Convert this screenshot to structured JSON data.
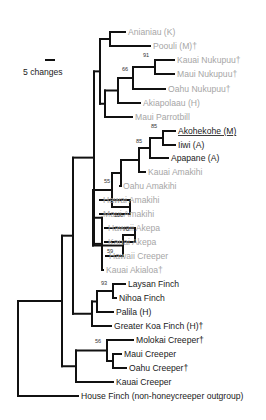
{
  "figure": {
    "scale_bar": {
      "label": "5 changes"
    },
    "leaves": [
      {
        "id": "anianiau",
        "label": "Anianiau (K)",
        "status": "gray"
      },
      {
        "id": "poouli",
        "label": "Poouli (M)†",
        "status": "gray"
      },
      {
        "id": "kauai-nukupuu",
        "label": "Kauai Nukupuu†",
        "status": "gray"
      },
      {
        "id": "maui-nukupuu",
        "label": "Maui Nukupuu†",
        "status": "gray"
      },
      {
        "id": "oahu-nukupuu",
        "label": "Oahu Nukupuu†",
        "status": "gray"
      },
      {
        "id": "akiapolaau",
        "label": "Akiapolaau (H)",
        "status": "gray"
      },
      {
        "id": "maui-parrotbill",
        "label": "Maui Parrotbill",
        "status": "gray"
      },
      {
        "id": "akohekohe",
        "label": "Akohekohe (M)",
        "status": "dark",
        "underline": true
      },
      {
        "id": "iiwi",
        "label": "Iiwi (A)",
        "status": "dark"
      },
      {
        "id": "apapane",
        "label": "Apapane (A)",
        "status": "dark"
      },
      {
        "id": "kauai-amakihi",
        "label": "Kauai Amakihi",
        "status": "gray"
      },
      {
        "id": "oahu-amakihi",
        "label": "Oahu Amakihi",
        "status": "gray"
      },
      {
        "id": "hawai-amakihi",
        "label": "Hawai Amakihi",
        "status": "gray"
      },
      {
        "id": "maui-amakihi",
        "label": "Maui Amakihi",
        "status": "gray"
      },
      {
        "id": "hawaii-akepa",
        "label": "Hawaii Akepa",
        "status": "gray"
      },
      {
        "id": "kauai-akepa",
        "label": "Kauai Akepa",
        "status": "gray"
      },
      {
        "id": "hawaii-creeper",
        "label": "Hawaii Creeper",
        "status": "gray"
      },
      {
        "id": "kauai-akialoa",
        "label": "Kauai Akialoa†",
        "status": "gray"
      },
      {
        "id": "laysan-finch",
        "label": "Laysan Finch",
        "status": "dark"
      },
      {
        "id": "nihoa-finch",
        "label": "Nihoa Finch",
        "status": "dark"
      },
      {
        "id": "palila",
        "label": "Palila (H)",
        "status": "dark"
      },
      {
        "id": "greater-koa-finch",
        "label": "Greater Koa Finch (H)†",
        "status": "dark"
      },
      {
        "id": "molokai-creeper",
        "label": "Molokai Creeper†",
        "status": "dark"
      },
      {
        "id": "maui-creeper",
        "label": "Maui Creeper",
        "status": "dark"
      },
      {
        "id": "oahu-creeper",
        "label": "Oahu Creeper†",
        "status": "dark"
      },
      {
        "id": "kauai-creeper",
        "label": "Kauai Creeper",
        "status": "dark"
      },
      {
        "id": "house-finch",
        "label": "House Finch (non-honeycreeper outgroup)",
        "status": "dark"
      }
    ],
    "bootstrap": [
      {
        "id": "nukupuu-kauai-maui",
        "value": "91"
      },
      {
        "id": "nukupuu-clade",
        "value": "66"
      },
      {
        "id": "akohekohe-iiwi",
        "value": "85"
      },
      {
        "id": "akohekohe-iiwi-apapane",
        "value": "85"
      },
      {
        "id": "amakihi-group",
        "value": "55"
      },
      {
        "id": "hawai-maui-amakihi",
        "value": "100"
      },
      {
        "id": "akepa-pair",
        "value": "70"
      },
      {
        "id": "akepa-creeper",
        "value": "59"
      },
      {
        "id": "laysan-nihoa",
        "value": "93"
      },
      {
        "id": "molokai-maui-oahu-creeper",
        "value": "56"
      }
    ],
    "colors": {
      "dark_label": "#1a1a1a",
      "gray_label": "#a6a6a6",
      "branch": "#111111"
    }
  }
}
